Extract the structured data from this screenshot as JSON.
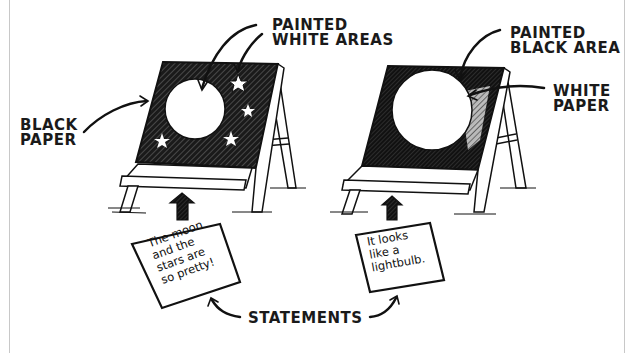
{
  "labels": {
    "painted_white_areas": [
      "Painted",
      "White Areas"
    ],
    "black_paper": [
      "Black",
      "Paper"
    ],
    "painted_black_area": [
      "Painted",
      "Black Area"
    ],
    "white_paper": [
      "White",
      "Paper"
    ],
    "statements": "Statements"
  },
  "notes": {
    "left": [
      "The moon",
      "and the",
      "stars are",
      "so pretty!"
    ],
    "right": [
      "It looks",
      "like a",
      "lightbulb."
    ]
  },
  "easels": [
    {
      "name": "left-easel",
      "paper": "black",
      "painted": [
        "circle",
        "star",
        "star",
        "star",
        "star"
      ],
      "paint_color": "#ffffff"
    },
    {
      "name": "right-easel",
      "paper": "white",
      "painted": [
        "black surround"
      ],
      "paint_color": "#111111"
    }
  ],
  "colors": {
    "ink": "#111111",
    "paper": "#ffffff",
    "frame": "#c8c8c8"
  }
}
